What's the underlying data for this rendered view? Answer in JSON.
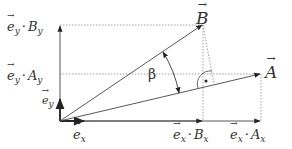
{
  "diagram": {
    "colors": {
      "line": "#333333",
      "dotted": "#888888",
      "background": "#ffffff"
    },
    "points": {
      "origin": [
        60,
        121
      ],
      "A_tip": [
        261,
        74
      ],
      "B_tip": [
        203,
        24
      ],
      "foot_perp": [
        214,
        84
      ]
    },
    "labels": {
      "B": {
        "base": "B"
      },
      "A": {
        "base": "A"
      },
      "beta": "β",
      "ey_By": {
        "e": "e",
        "e_sub": "y",
        "dot": "·",
        "comp": "B",
        "comp_sub": "y"
      },
      "ey_Ay": {
        "e": "e",
        "e_sub": "y",
        "dot": "·",
        "comp": "A",
        "comp_sub": "y"
      },
      "ey": {
        "e": "e",
        "e_sub": "y"
      },
      "ex": {
        "e": "e",
        "e_sub": "x"
      },
      "ex_Bx": {
        "e": "e",
        "e_sub": "x",
        "dot": "·",
        "comp": "B",
        "comp_sub": "x"
      },
      "ex_Ax": {
        "e": "e",
        "e_sub": "x",
        "dot": "·",
        "comp": "A",
        "comp_sub": "x"
      }
    },
    "right_angle_marker": "·"
  }
}
